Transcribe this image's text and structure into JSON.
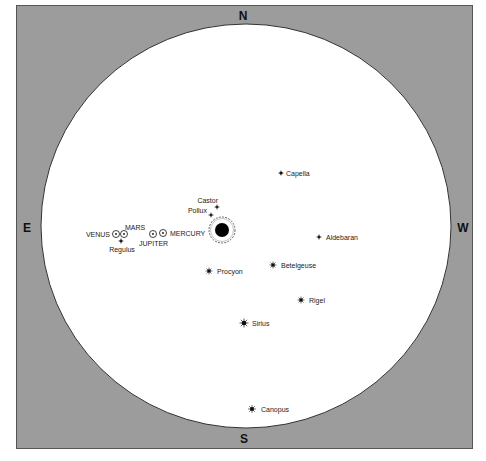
{
  "map": {
    "title": "",
    "background_color": "#9c9c9c",
    "sky_color": "#ffffff",
    "cardinals": {
      "north": "N",
      "south": "S",
      "east": "E",
      "west": "W"
    },
    "sun": {
      "name": "Sun",
      "x": 222,
      "y": 230
    },
    "planets": [
      {
        "name": "VENUS",
        "x": 116,
        "y": 234
      },
      {
        "name": "MARS",
        "x": 124,
        "y": 234
      },
      {
        "name": "JUPITER",
        "x": 153,
        "y": 234
      },
      {
        "name": "MERCURY",
        "x": 163,
        "y": 233
      }
    ],
    "stars": [
      {
        "name": "Castor",
        "x": 217,
        "y": 207
      },
      {
        "name": "Pollux",
        "x": 211,
        "y": 215
      },
      {
        "name": "Capella",
        "x": 281,
        "y": 173
      },
      {
        "name": "Aldebaran",
        "x": 319,
        "y": 237
      },
      {
        "name": "Regulus",
        "x": 121,
        "y": 241
      },
      {
        "name": "Procyon",
        "x": 209,
        "y": 271
      },
      {
        "name": "Betelgeuse",
        "x": 273,
        "y": 265
      },
      {
        "name": "Rigel",
        "x": 301,
        "y": 300
      },
      {
        "name": "Sirius",
        "x": 244,
        "y": 323
      },
      {
        "name": "Canopus",
        "x": 252,
        "y": 409
      }
    ]
  }
}
